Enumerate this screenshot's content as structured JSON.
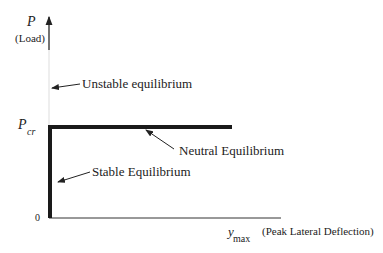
{
  "diagram": {
    "y_axis": {
      "symbol": "P",
      "label": "(Load)"
    },
    "x_axis": {
      "symbol": "y",
      "subscript": "max",
      "label": "(Peak Lateral Deflection)"
    },
    "ticks": {
      "pcr_symbol": "P",
      "pcr_subscript": "cr",
      "origin": "0"
    },
    "annotations": {
      "unstable": "Unstable equilibrium",
      "neutral": "Neutral Equilibrium",
      "stable": "Stable Equilibrium"
    },
    "colors": {
      "line": "#1a1a1a",
      "text": "#222222"
    }
  }
}
